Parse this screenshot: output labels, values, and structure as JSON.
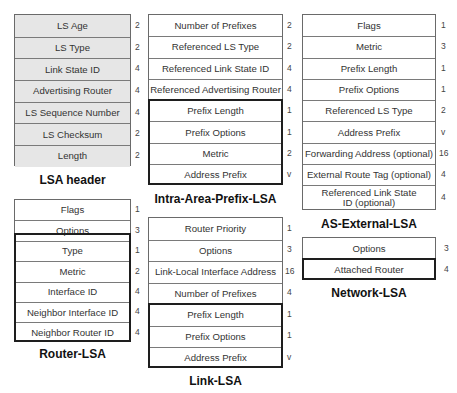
{
  "diagrams": {
    "lsa_header": {
      "caption": "LSA header",
      "fields": [
        {
          "name": "LS Age",
          "size": "2"
        },
        {
          "name": "LS Type",
          "size": "2"
        },
        {
          "name": "Link State ID",
          "size": "4"
        },
        {
          "name": "Advertising Router",
          "size": "4"
        },
        {
          "name": "LS Sequence Number",
          "size": "4"
        },
        {
          "name": "LS Checksum",
          "size": "2"
        },
        {
          "name": "Length",
          "size": "2"
        }
      ]
    },
    "router_lsa": {
      "caption": "Router-LSA",
      "fields": [
        {
          "name": "Flags",
          "size": "1"
        },
        {
          "name": "Options",
          "size": "3"
        },
        {
          "name": "Type",
          "size": "1"
        },
        {
          "name": "Metric",
          "size": "2"
        },
        {
          "name": "Interface ID",
          "size": "4"
        },
        {
          "name": "Neighbor Interface ID",
          "size": "4"
        },
        {
          "name": "Neighbor Router ID",
          "size": "4"
        }
      ]
    },
    "intra_area_prefix_lsa": {
      "caption": "Intra-Area-Prefix-LSA",
      "fields": [
        {
          "name": "Number of Prefixes",
          "size": "2"
        },
        {
          "name": "Referenced LS Type",
          "size": "2"
        },
        {
          "name": "Referenced Link State ID",
          "size": "4"
        },
        {
          "name": "Referenced Advertising Router",
          "size": "4"
        },
        {
          "name": "Prefix Length",
          "size": "1"
        },
        {
          "name": "Prefix Options",
          "size": "1"
        },
        {
          "name": "Metric",
          "size": "2"
        },
        {
          "name": "Address Prefix",
          "size": "v"
        }
      ]
    },
    "link_lsa": {
      "caption": "Link-LSA",
      "fields": [
        {
          "name": "Router Priority",
          "size": "1"
        },
        {
          "name": "Options",
          "size": "3"
        },
        {
          "name": "Link-Local Interface Address",
          "size": "16"
        },
        {
          "name": "Number of Prefixes",
          "size": "4"
        },
        {
          "name": "Prefix Length",
          "size": "1"
        },
        {
          "name": "Prefix Options",
          "size": "1"
        },
        {
          "name": "Address Prefix",
          "size": "v"
        }
      ]
    },
    "as_external_lsa": {
      "caption": "AS-External-LSA",
      "fields": [
        {
          "name": "Flags",
          "size": "1"
        },
        {
          "name": "Metric",
          "size": "3"
        },
        {
          "name": "Prefix Length",
          "size": "1"
        },
        {
          "name": "Prefix Options",
          "size": "1"
        },
        {
          "name": "Referenced LS Type",
          "size": "2"
        },
        {
          "name": "Address Prefix",
          "size": "v"
        },
        {
          "name": "Forwarding Address (optional)",
          "size": "16"
        },
        {
          "name": "External Route Tag (optional)",
          "size": "4"
        },
        {
          "name": "Referenced Link State ID (optional)",
          "size": "4"
        }
      ]
    },
    "network_lsa": {
      "caption": "Network-LSA",
      "fields": [
        {
          "name": "Options",
          "size": "3"
        },
        {
          "name": "Attached Router",
          "size": "4"
        }
      ]
    }
  }
}
